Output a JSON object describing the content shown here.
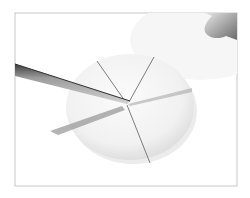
{
  "image": {
    "description": "Photograph of a knife cutting a round disc of white dough into wedges; a finger is visible at the top right, framed by a thin gray border",
    "subject": "dough-disc-cut-into-wedges",
    "objects": [
      "knife",
      "dough-disc",
      "finger",
      "photo-frame"
    ],
    "wedge_count": 5
  },
  "colors": {
    "background": "#ffffff",
    "frame_border": "#c8c8c8",
    "dough": "#f4f4f4",
    "dough_shadow": "#dcdcdc",
    "cut_line": "#6e6e6e",
    "knife_blade_light": "#c0c0c0",
    "knife_blade_dark": "#4a4a4a",
    "finger": "#9a9a9a"
  }
}
